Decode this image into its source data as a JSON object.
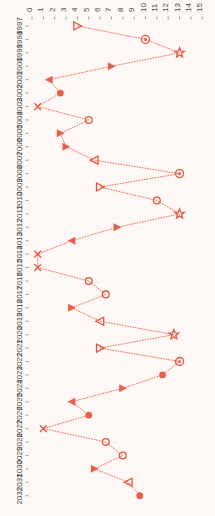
{
  "chart_data": {
    "type": "line",
    "orientation": "vertical",
    "title": "",
    "subtitle": "",
    "xlabel": "",
    "ylabel": "",
    "xlim": [
      0,
      15
    ],
    "ylim": [
      1997,
      2032
    ],
    "grid": false,
    "legend": false,
    "legend_position": "none",
    "accent_color": "#e8604c",
    "background_color": "#fdf7f5",
    "text_color": "#4a4a4a",
    "x_ticks": [
      "0",
      "1",
      "2",
      "3",
      "4",
      "5",
      "6",
      "7",
      "8",
      "9",
      "10",
      "11",
      "12",
      "13",
      "14",
      "15"
    ],
    "x_tick_values": [
      0,
      1,
      2,
      3,
      4,
      5,
      6,
      7,
      8,
      9,
      10,
      11,
      12,
      13,
      14,
      15
    ],
    "y_ticks": [
      "1997",
      "1998",
      "1999",
      "2000",
      "2001",
      "2002",
      "2003",
      "2004",
      "2005",
      "2006",
      "2007",
      "2008",
      "2009",
      "2010",
      "2011",
      "2012",
      "2013",
      "2014",
      "2015",
      "2016",
      "2017",
      "2018",
      "2019",
      "2020",
      "2021",
      "2022",
      "2023",
      "2024",
      "2025",
      "2026",
      "2027",
      "2028",
      "2029",
      "2030",
      "2031",
      "2032"
    ],
    "marker_shapes": [
      "triangle-right-open",
      "circle-dot",
      "star",
      "triangle-right-filled",
      "triangle-left-filled",
      "circle-filled",
      "x-mark",
      "circle-open",
      "triangle-right-filled",
      "triangle-right-filled",
      "triangle-left-open",
      "circle-dot",
      "triangle-right-open",
      "circle-open",
      "star",
      "triangle-right-filled",
      "triangle-left-filled",
      "x-mark",
      "x-mark",
      "circle-open",
      "circle-open",
      "triangle-right-filled",
      "triangle-left-open",
      "star",
      "triangle-right-open",
      "circle-dot",
      "circle-filled",
      "triangle-right-filled",
      "triangle-left-filled",
      "circle-filled",
      "x-mark",
      "circle-open",
      "circle-open",
      "triangle-right-filled",
      "triangle-left-open",
      "circle-filled"
    ],
    "categories": [
      "1997",
      "1998",
      "1999",
      "2000",
      "2001",
      "2002",
      "2003",
      "2004",
      "2005",
      "2006",
      "2007",
      "2008",
      "2009",
      "2010",
      "2011",
      "2012",
      "2013",
      "2014",
      "2015",
      "2016",
      "2017",
      "2018",
      "2019",
      "2020",
      "2021",
      "2022",
      "2023",
      "2024",
      "2025",
      "2026",
      "2027",
      "2028",
      "2029",
      "2030",
      "2031",
      "2032"
    ],
    "values": [
      4.0,
      10.0,
      13.0,
      7.0,
      1.5,
      2.5,
      0.5,
      5.0,
      2.5,
      3.0,
      5.5,
      13.0,
      6.0,
      11.0,
      13.0,
      7.5,
      3.5,
      0.5,
      0.5,
      5.0,
      6.5,
      3.5,
      6.0,
      12.5,
      6.0,
      13.0,
      11.5,
      8.0,
      3.5,
      5.0,
      1.0,
      6.5,
      8.0,
      5.5,
      8.5,
      9.5
    ],
    "series": [
      {
        "name": "series-1",
        "points": [
          {
            "y": "1997",
            "x": 4.0,
            "marker": "triangle-right-open"
          },
          {
            "y": "1998",
            "x": 10.0,
            "marker": "circle-dot"
          },
          {
            "y": "1999",
            "x": 13.0,
            "marker": "star"
          },
          {
            "y": "2000",
            "x": 7.0,
            "marker": "triangle-right-filled"
          },
          {
            "y": "2001",
            "x": 1.5,
            "marker": "triangle-left-filled"
          },
          {
            "y": "2002",
            "x": 2.5,
            "marker": "circle-filled"
          },
          {
            "y": "2003",
            "x": 0.5,
            "marker": "x-mark"
          },
          {
            "y": "2004",
            "x": 5.0,
            "marker": "circle-open"
          },
          {
            "y": "2005",
            "x": 2.5,
            "marker": "triangle-right-filled"
          },
          {
            "y": "2006",
            "x": 3.0,
            "marker": "triangle-right-filled"
          },
          {
            "y": "2007",
            "x": 5.5,
            "marker": "triangle-left-open"
          },
          {
            "y": "2008",
            "x": 13.0,
            "marker": "circle-dot"
          },
          {
            "y": "2009",
            "x": 6.0,
            "marker": "triangle-right-open"
          },
          {
            "y": "2010",
            "x": 11.0,
            "marker": "circle-open"
          },
          {
            "y": "2011",
            "x": 13.0,
            "marker": "star"
          },
          {
            "y": "2012",
            "x": 7.5,
            "marker": "triangle-right-filled"
          },
          {
            "y": "2013",
            "x": 3.5,
            "marker": "triangle-left-filled"
          },
          {
            "y": "2014",
            "x": 0.5,
            "marker": "x-mark"
          },
          {
            "y": "2015",
            "x": 0.5,
            "marker": "x-mark"
          },
          {
            "y": "2016",
            "x": 5.0,
            "marker": "circle-open"
          },
          {
            "y": "2017",
            "x": 6.5,
            "marker": "circle-open"
          },
          {
            "y": "2018",
            "x": 3.5,
            "marker": "triangle-right-filled"
          },
          {
            "y": "2019",
            "x": 6.0,
            "marker": "triangle-left-open"
          },
          {
            "y": "2020",
            "x": 12.5,
            "marker": "star"
          },
          {
            "y": "2021",
            "x": 6.0,
            "marker": "triangle-right-open"
          },
          {
            "y": "2022",
            "x": 13.0,
            "marker": "circle-dot"
          },
          {
            "y": "2023",
            "x": 11.5,
            "marker": "circle-filled"
          },
          {
            "y": "2024",
            "x": 8.0,
            "marker": "triangle-right-filled"
          },
          {
            "y": "2025",
            "x": 3.5,
            "marker": "triangle-left-filled"
          },
          {
            "y": "2026",
            "x": 5.0,
            "marker": "circle-filled"
          },
          {
            "y": "2027",
            "x": 1.0,
            "marker": "x-mark"
          },
          {
            "y": "2028",
            "x": 6.5,
            "marker": "circle-open"
          },
          {
            "y": "2029",
            "x": 8.0,
            "marker": "circle-open"
          },
          {
            "y": "2030",
            "x": 5.5,
            "marker": "triangle-right-filled"
          },
          {
            "y": "2031",
            "x": 8.5,
            "marker": "triangle-left-open"
          },
          {
            "y": "2032",
            "x": 9.5,
            "marker": "circle-filled"
          }
        ]
      }
    ]
  }
}
